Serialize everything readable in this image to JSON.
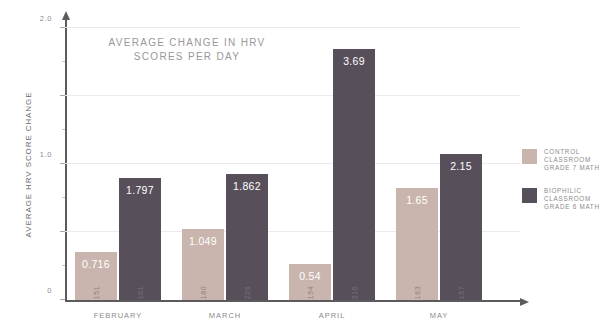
{
  "chart_data": {
    "type": "bar",
    "title": "AVERAGE CHANGE IN HRV\nSCORES PER DAY",
    "xlabel": "",
    "ylabel": "AVERAGE HRV SCORE CHANGE",
    "ylim": [
      0,
      4.0
    ],
    "grid": true,
    "legend_position": "right",
    "ytick_labels": [
      "0",
      "1.0",
      "2.0",
      "3.0",
      "4.0"
    ],
    "ytick_values": [
      0,
      1.0,
      2.0,
      3.0,
      4.0
    ],
    "yminor_values": [
      0.5,
      1.5,
      2.5,
      3.5
    ],
    "categories": [
      "FEBRUARY",
      "MARCH",
      "APRIL",
      "MAY"
    ],
    "series": [
      {
        "name": "CONTROL\nCLASSROOM\nGRADE 7 MATH",
        "color": "#c9b5ad",
        "values": [
          0.716,
          1.049,
          0.54,
          1.65
        ],
        "value_labels": [
          "0.716",
          "1.049",
          "0.54",
          "1.65"
        ],
        "counts": [
          "151",
          "180",
          "194",
          "163"
        ]
      },
      {
        "name": "BIOPHILIC\nCLASSROOM\nGRADE 6 MATH",
        "color": "#57505b",
        "values": [
          1.797,
          1.862,
          3.69,
          2.15
        ],
        "value_labels": [
          "1.797",
          "1.862",
          "3.69",
          "2.15"
        ],
        "counts": [
          "161",
          "226",
          "216",
          "157"
        ]
      }
    ]
  },
  "legend": {
    "items": [
      {
        "label": "CONTROL\nCLASSROOM\nGRADE 7 MATH",
        "color": "#c9b5ad"
      },
      {
        "label": "BIOPHILIC\nCLASSROOM\nGRADE 6 MATH",
        "color": "#57505b"
      }
    ]
  },
  "colors": {
    "control": "#c9b5ad",
    "biophilic": "#57505b",
    "axis": "#5d5a5e",
    "grid": "#eceaec",
    "text": "#8d898d",
    "title_text": "#9b979b"
  }
}
